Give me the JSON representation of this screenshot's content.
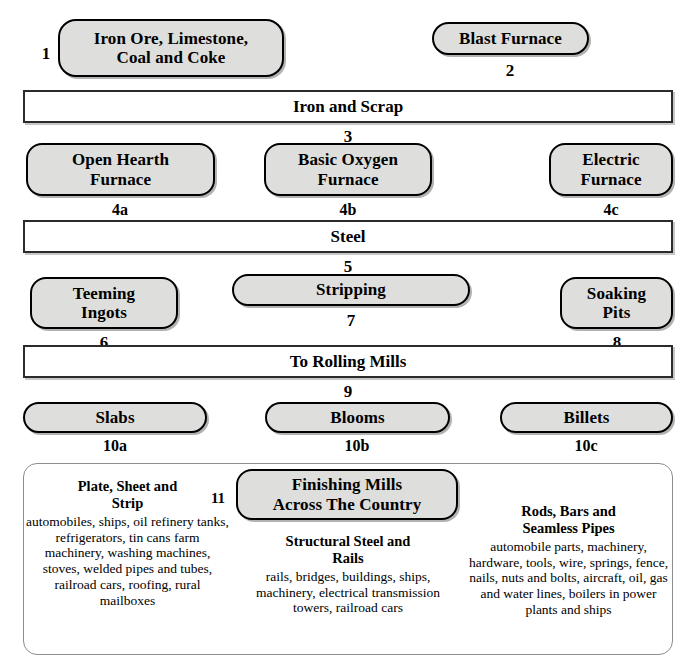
{
  "diagram": {
    "colors": {
      "pill_fill": "#dededc",
      "pill_border": "#000000",
      "bar_fill": "#ffffff",
      "bar_border": "#2b2b2b",
      "bigbox_border": "#8d8d8d",
      "text": "#000000",
      "background": "#ffffff"
    },
    "stages": [
      {
        "id": "1",
        "label": "Iron Ore, Limestone,\nCoal and Coke",
        "shape": "pill"
      },
      {
        "id": "2",
        "label": "Blast Furnace",
        "shape": "pill"
      },
      {
        "id": "3",
        "label": "Iron and Scrap",
        "shape": "bar"
      },
      {
        "id": "4a",
        "label": "Open Hearth\nFurnace",
        "shape": "pill"
      },
      {
        "id": "4b",
        "label": "Basic Oxygen\nFurnace",
        "shape": "pill"
      },
      {
        "id": "4c",
        "label": "Electric\nFurnace",
        "shape": "pill"
      },
      {
        "id": "5",
        "label": "Steel",
        "shape": "bar"
      },
      {
        "id": "6",
        "label": "Teeming\nIngots",
        "shape": "pill"
      },
      {
        "id": "7",
        "label": "Stripping",
        "shape": "pill"
      },
      {
        "id": "8",
        "label": "Soaking\nPits",
        "shape": "pill"
      },
      {
        "id": "9",
        "label": "To Rolling Mills",
        "shape": "bar"
      },
      {
        "id": "10a",
        "label": "Slabs",
        "shape": "pill"
      },
      {
        "id": "10b",
        "label": "Blooms",
        "shape": "pill"
      },
      {
        "id": "10c",
        "label": "Billets",
        "shape": "pill"
      },
      {
        "id": "11",
        "label": "Finishing Mills\nAcross The Country",
        "shape": "pill"
      }
    ],
    "nodes": {
      "n1": {
        "line1": "Iron Ore, Limestone,",
        "line2": "Coal and Coke"
      },
      "n2": {
        "line1": "Blast Furnace"
      },
      "n3": {
        "line1": "Iron and Scrap"
      },
      "n4a": {
        "line1": "Open Hearth",
        "line2": "Furnace"
      },
      "n4b": {
        "line1": "Basic Oxygen",
        "line2": "Furnace"
      },
      "n4c": {
        "line1": "Electric",
        "line2": "Furnace"
      },
      "n5": {
        "line1": "Steel"
      },
      "n6": {
        "line1": "Teeming",
        "line2": "Ingots"
      },
      "n7": {
        "line1": "Stripping"
      },
      "n8": {
        "line1": "Soaking",
        "line2": "Pits"
      },
      "n9": {
        "line1": "To Rolling Mills"
      },
      "n10a": {
        "line1": "Slabs"
      },
      "n10b": {
        "line1": "Blooms"
      },
      "n10c": {
        "line1": "Billets"
      },
      "n11": {
        "line1": "Finishing Mills",
        "line2": "Across The Country"
      }
    },
    "numbers": {
      "l1": "1",
      "l2": "2",
      "l3": "3",
      "l4a": "4a",
      "l4b": "4b",
      "l4c": "4c",
      "l5": "5",
      "l6": "6",
      "l7": "7",
      "l8": "8",
      "l9": "9",
      "l10a": "10a",
      "l10b": "10b",
      "l10c": "10c",
      "l11": "11"
    },
    "products": {
      "left": {
        "heading_line1": "Plate, Sheet and",
        "heading_line2": "Strip",
        "items": "automobiles, ships, oil refinery tanks, refrigerators, tin cans farm machinery, washing machines, stoves, welded pipes and tubes, railroad cars, roofing, rural mailboxes"
      },
      "middle": {
        "heading_line1": "Structural Steel and",
        "heading_line2": "Rails",
        "items": "rails, bridges, buildings, ships, machinery, electrical transmission towers, railroad cars"
      },
      "right": {
        "heading_line1": "Rods, Bars and",
        "heading_line2": "Seamless Pipes",
        "items": "automobile parts, machinery, hardware, tools, wire, springs, fence, nails, nuts and bolts, aircraft, oil, gas and water lines, boilers in power plants and ships"
      }
    }
  }
}
